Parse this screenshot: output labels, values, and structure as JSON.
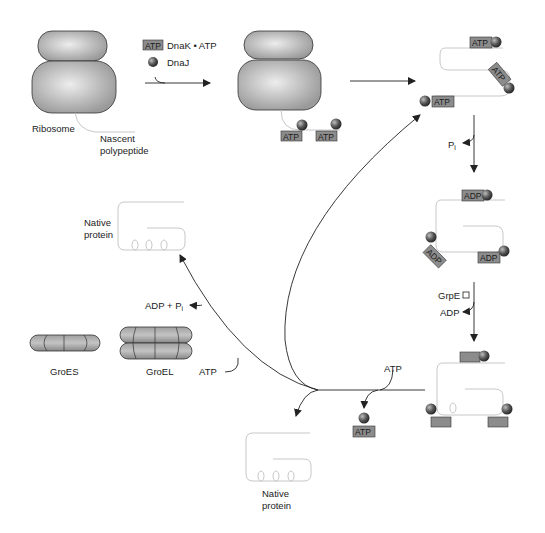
{
  "diagram": {
    "legend": {
      "atp_tag": "ATP",
      "dnak_atp": "DnaK • ATP",
      "dnaj": "DnaJ"
    },
    "labels": {
      "ribosome": "Ribosome",
      "nascent_line1": "Nascent",
      "nascent_line2": "polypeptide",
      "pi": "P",
      "pi_sub": "i",
      "grpe": "GrpE",
      "adp_release": "ADP",
      "atp_input_bottom": "ATP",
      "native_top_line1": "Native",
      "native_top_line2": "protein",
      "adp_pi": "ADP + P",
      "adp_pi_sub": "i",
      "groes": "GroES",
      "groel": "GroEL",
      "atp_groel": "ATP",
      "native_bottom_line1": "Native",
      "native_bottom_line2": "protein"
    },
    "tags": {
      "atp": "ATP",
      "adp": "ADP"
    },
    "colors": {
      "ribosome": "#b5b5b5",
      "tag_fill": "#8c8c8c",
      "tag_stroke": "#333333",
      "sphere": "#555555",
      "polypeptide": "#c8c8c8",
      "arrow": "#222222"
    }
  }
}
